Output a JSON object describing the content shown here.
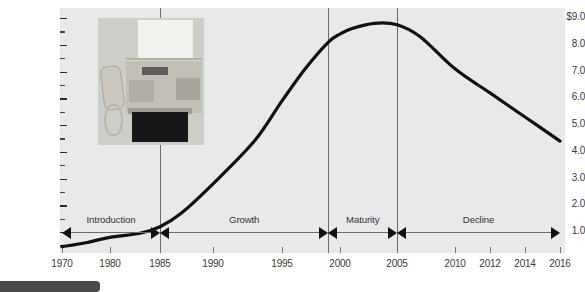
{
  "chart_data": {
    "type": "line",
    "title": "",
    "subtitle": "",
    "xlabel": "",
    "ylabel": "Worldwide sales ($ billions)",
    "ylim": [
      0,
      9.0
    ],
    "xlim": [
      1970,
      2016
    ],
    "grid": false,
    "legend": "none",
    "y_ticks": [
      "$9.0",
      "8.0",
      "7.0",
      "6.0",
      "5.0",
      "4.0",
      "3.0",
      "2.0",
      "1.0"
    ],
    "y_tick_values": [
      9.0,
      8.0,
      7.0,
      6.0,
      5.0,
      4.0,
      3.0,
      2.0,
      1.0
    ],
    "y_minor_ticks": [
      8.5,
      7.5,
      6.5,
      5.5,
      4.5,
      3.5,
      2.5,
      1.5,
      0.5
    ],
    "x_ticks": [
      "1970",
      "1980",
      "1985",
      "1990",
      "1995",
      "2000",
      "2005",
      "2010",
      "2012",
      "2014",
      "2016"
    ],
    "x_tick_values": [
      1970,
      1980,
      1985,
      1990,
      1995,
      2000,
      2005,
      2010,
      2012,
      2014,
      2016
    ],
    "series": [
      {
        "name": "Worldwide fax machine sales",
        "x": [
          1970,
          1975,
          1980,
          1983,
          1985,
          1987,
          1990,
          1993,
          1995,
          1997,
          1999,
          2000,
          2001,
          2003,
          2005,
          2007,
          2010,
          2012,
          2014,
          2016
        ],
        "values": [
          0.45,
          0.6,
          0.8,
          0.95,
          1.2,
          1.7,
          2.8,
          4.4,
          5.9,
          7.1,
          8.1,
          8.4,
          8.6,
          8.8,
          8.75,
          8.3,
          7.1,
          6.2,
          5.3,
          4.4
        ]
      }
    ],
    "annotations": [
      {
        "type": "divider",
        "x": 1985,
        "label": "introduction-growth-divider"
      },
      {
        "type": "divider",
        "x": 1999,
        "label": "growth-maturity-divider"
      },
      {
        "type": "divider",
        "x": 2005,
        "label": "maturity-decline-divider"
      }
    ]
  },
  "axes": {
    "y_title": "Worldwide sales ($ billions)"
  },
  "stages": [
    {
      "label": "Introduction",
      "start": 1970,
      "end": 1985
    },
    {
      "label": "Growth",
      "start": 1985,
      "end": 1999
    },
    {
      "label": "Maturity",
      "start": 1999,
      "end": 2005
    },
    {
      "label": "Decline",
      "start": 2005,
      "end": 2016
    }
  ],
  "photo": {
    "name": "fax-machine-photo",
    "caption": ""
  },
  "colors": {
    "plot_background": "#e9e9e9",
    "curve": "#111111",
    "axis_text": "#3a3a3a",
    "divider": "#6b6b6b",
    "bottom_bar": "#4a4a4a"
  }
}
